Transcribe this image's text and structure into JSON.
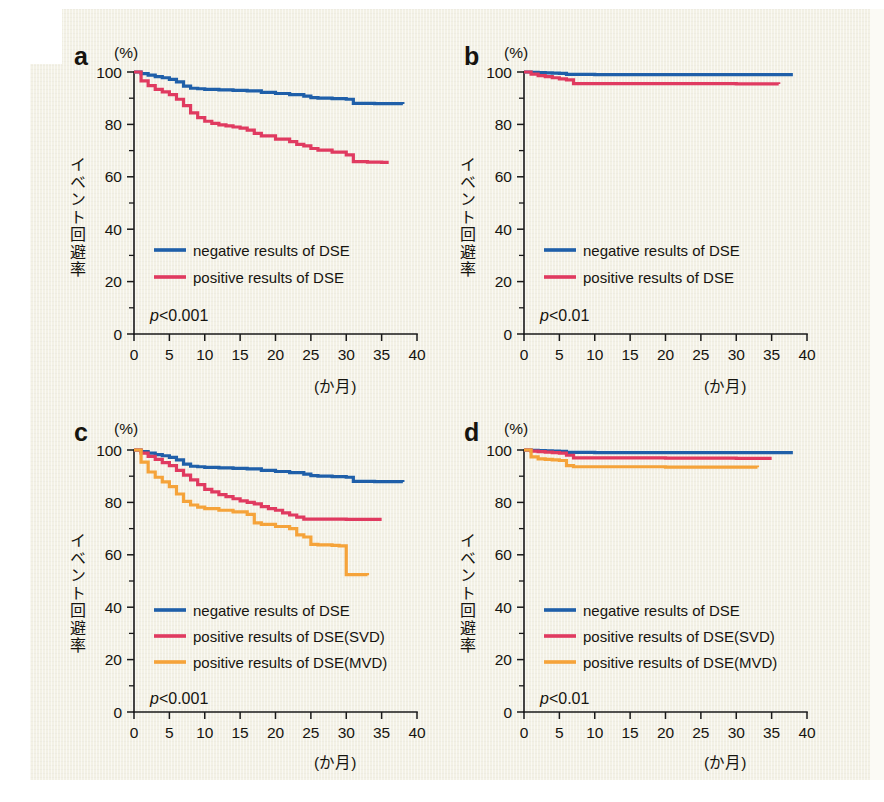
{
  "figure": {
    "background_color": "#f3f1e5",
    "panels": [
      "a",
      "b",
      "c",
      "d"
    ]
  },
  "colors": {
    "negative_dse": "#1f5fa9",
    "positive_dse": "#e03a60",
    "positive_dse_svd": "#e03a60",
    "positive_dse_mvd": "#f5a33a",
    "axis": "#1a1a1a",
    "text": "#16140f"
  },
  "axes": {
    "y_unit_label": "(%)",
    "y_axis_title": "イベント回避率",
    "x_unit_label": "(か月)",
    "y_ticks": [
      0,
      20,
      40,
      60,
      80,
      100
    ],
    "y_minor_ticks": [
      10,
      30,
      50,
      70,
      90
    ],
    "y_tick_labels": [
      "0",
      "20",
      "40",
      "60",
      "80",
      "100"
    ],
    "y_range": [
      0,
      100
    ],
    "x_ticks": [
      0,
      5,
      10,
      15,
      20,
      25,
      30,
      35,
      40
    ],
    "x_tick_labels": [
      "0",
      "5",
      "10",
      "15",
      "20",
      "25",
      "30",
      "35",
      "40"
    ],
    "x_range": [
      0,
      40
    ]
  },
  "chart_data": [
    {
      "id": "panel-a",
      "panel_letter": "a",
      "type": "line",
      "title": "",
      "xlabel": "(か月)",
      "ylabel": "イベント回避率",
      "y_unit": "(%)",
      "xlim": [
        0,
        40
      ],
      "ylim": [
        0,
        100
      ],
      "grid": false,
      "legend_position": "inside-lower-left",
      "annotation": "p<0.001",
      "annotation_prefix": "p",
      "annotation_suffix": "<0.001",
      "series": [
        {
          "name": "negative results of DSE",
          "color": "#1f5fa9",
          "x": [
            0,
            1,
            2,
            3,
            4,
            5,
            6,
            7,
            8,
            9,
            10,
            12,
            14,
            16,
            18,
            20,
            22,
            24,
            25,
            26,
            28,
            30,
            31,
            34,
            38
          ],
          "values": [
            100,
            99.4,
            98.8,
            98.2,
            97.8,
            97.2,
            96.2,
            94.6,
            93.8,
            93.6,
            93.4,
            93.2,
            93.0,
            92.8,
            92.2,
            91.8,
            91.4,
            90.8,
            90.2,
            90.0,
            89.8,
            89.6,
            88.0,
            87.9,
            87.8
          ]
        },
        {
          "name": "positive results of DSE",
          "color": "#e03a60",
          "x": [
            0,
            1,
            2,
            3,
            4,
            5,
            6,
            7,
            8,
            9,
            10,
            11,
            12,
            13,
            14,
            15,
            16,
            17,
            18,
            20,
            22,
            23,
            24,
            25,
            26,
            28,
            30,
            31,
            33,
            35,
            36
          ],
          "values": [
            100,
            96.6,
            94.8,
            93.4,
            92.4,
            91.4,
            89.6,
            87.2,
            84.4,
            82.6,
            81.2,
            80.4,
            79.8,
            79.4,
            79.0,
            78.6,
            77.8,
            76.6,
            75.6,
            74.4,
            73.4,
            72.4,
            71.8,
            70.8,
            70.2,
            69.4,
            68.4,
            65.8,
            65.6,
            65.5,
            65.5
          ]
        }
      ],
      "legend": [
        {
          "label": "negative results of DSE",
          "color": "#1f5fa9"
        },
        {
          "label": "positive results of DSE",
          "color": "#e03a60"
        }
      ]
    },
    {
      "id": "panel-b",
      "panel_letter": "b",
      "type": "line",
      "title": "",
      "xlabel": "(か月)",
      "ylabel": "イベント回避率",
      "y_unit": "(%)",
      "xlim": [
        0,
        40
      ],
      "ylim": [
        0,
        100
      ],
      "grid": false,
      "legend_position": "inside-lower-left",
      "annotation": "p<0.01",
      "annotation_prefix": "p",
      "annotation_suffix": "<0.01",
      "series": [
        {
          "name": "negative results of DSE",
          "color": "#1f5fa9",
          "x": [
            0,
            1,
            2,
            3,
            4,
            5,
            6,
            10,
            20,
            30,
            38
          ],
          "values": [
            100,
            99.9,
            99.8,
            99.7,
            99.6,
            99.5,
            99.1,
            99.0,
            99.0,
            99.0,
            99.0
          ]
        },
        {
          "name": "positive results of DSE",
          "color": "#e03a60",
          "x": [
            0,
            1,
            2,
            3,
            4,
            5,
            6,
            7,
            10,
            20,
            30,
            36
          ],
          "values": [
            100,
            99.2,
            98.6,
            98.2,
            97.8,
            97.4,
            97.0,
            95.6,
            95.6,
            95.6,
            95.5,
            95.4
          ]
        }
      ],
      "legend": [
        {
          "label": "negative results of DSE",
          "color": "#1f5fa9"
        },
        {
          "label": "positive results of DSE",
          "color": "#e03a60"
        }
      ]
    },
    {
      "id": "panel-c",
      "panel_letter": "c",
      "type": "line",
      "title": "",
      "xlabel": "(か月)",
      "ylabel": "イベント回避率",
      "y_unit": "(%)",
      "xlim": [
        0,
        40
      ],
      "ylim": [
        0,
        100
      ],
      "grid": false,
      "legend_position": "inside-lower-left",
      "annotation": "p<0.001",
      "annotation_prefix": "p",
      "annotation_suffix": "<0.001",
      "series": [
        {
          "name": "negative results of DSE",
          "color": "#1f5fa9",
          "x": [
            0,
            1,
            2,
            3,
            4,
            5,
            6,
            7,
            8,
            9,
            10,
            12,
            14,
            16,
            18,
            20,
            22,
            24,
            25,
            26,
            28,
            30,
            31,
            34,
            38
          ],
          "values": [
            100,
            99.4,
            98.8,
            98.2,
            97.8,
            97.2,
            96.2,
            94.6,
            93.8,
            93.6,
            93.4,
            93.2,
            93.0,
            92.8,
            92.2,
            91.8,
            91.4,
            90.8,
            90.2,
            90.0,
            89.8,
            89.6,
            88.0,
            87.9,
            87.8
          ]
        },
        {
          "name": "positive results of DSE(SVD)",
          "color": "#e03a60",
          "x": [
            0,
            1,
            2,
            3,
            4,
            5,
            6,
            7,
            8,
            9,
            10,
            11,
            12,
            13,
            14,
            15,
            16,
            17,
            18,
            19,
            20,
            21,
            22,
            23,
            24,
            30,
            35
          ],
          "values": [
            100,
            98.8,
            97.6,
            96.4,
            95.2,
            94.0,
            92.2,
            90.4,
            88.6,
            86.8,
            85.0,
            84.0,
            83.0,
            82.2,
            81.4,
            80.6,
            80.0,
            79.4,
            78.4,
            77.6,
            77.0,
            76.0,
            75.2,
            74.4,
            73.6,
            73.5,
            73.5
          ]
        },
        {
          "name": "positive results of DSE(MVD)",
          "color": "#f5a33a",
          "x": [
            0,
            1,
            2,
            3,
            4,
            5,
            6,
            7,
            8,
            9,
            10,
            12,
            14,
            16,
            17,
            18,
            20,
            22,
            23,
            24,
            25,
            26,
            28,
            29,
            30,
            33
          ],
          "values": [
            100,
            95.4,
            91.6,
            89.6,
            87.8,
            86.0,
            83.2,
            80.4,
            79.0,
            78.2,
            77.6,
            77.0,
            76.4,
            75.4,
            72.2,
            71.6,
            70.8,
            70.0,
            67.6,
            66.8,
            64.0,
            63.8,
            63.6,
            63.4,
            52.4,
            52.2
          ]
        }
      ],
      "legend": [
        {
          "label": "negative results of DSE",
          "color": "#1f5fa9"
        },
        {
          "label": "positive results of DSE(SVD)",
          "color": "#e03a60"
        },
        {
          "label": "positive results of DSE(MVD)",
          "color": "#f5a33a"
        }
      ]
    },
    {
      "id": "panel-d",
      "panel_letter": "d",
      "type": "line",
      "title": "",
      "xlabel": "(か月)",
      "ylabel": "イベント回避率",
      "y_unit": "(%)",
      "xlim": [
        0,
        40
      ],
      "ylim": [
        0,
        100
      ],
      "grid": false,
      "legend_position": "inside-lower-left",
      "annotation": "p<0.01",
      "annotation_prefix": "p",
      "annotation_suffix": "<0.01",
      "series": [
        {
          "name": "negative results of DSE",
          "color": "#1f5fa9",
          "x": [
            0,
            1,
            2,
            3,
            4,
            5,
            6,
            10,
            20,
            30,
            38
          ],
          "values": [
            100,
            99.9,
            99.8,
            99.7,
            99.6,
            99.5,
            99.1,
            99.0,
            99.0,
            99.0,
            99.0
          ]
        },
        {
          "name": "positive results of DSE(SVD)",
          "color": "#e03a60",
          "x": [
            0,
            1,
            2,
            3,
            4,
            5,
            6,
            7,
            10,
            20,
            30,
            35
          ],
          "values": [
            100,
            99.6,
            99.4,
            99.2,
            99.0,
            98.8,
            98.0,
            97.0,
            97.0,
            96.9,
            96.8,
            96.8
          ]
        },
        {
          "name": "positive results of DSE(MVD)",
          "color": "#f5a33a",
          "x": [
            0,
            1,
            2,
            3,
            4,
            5,
            6,
            7,
            10,
            20,
            30,
            33
          ],
          "values": [
            100,
            97.4,
            96.6,
            96.4,
            96.2,
            96.0,
            94.0,
            93.6,
            93.6,
            93.5,
            93.5,
            93.4
          ]
        }
      ],
      "legend": [
        {
          "label": "negative results of DSE",
          "color": "#1f5fa9"
        },
        {
          "label": "positive results of DSE(SVD)",
          "color": "#e03a60"
        },
        {
          "label": "positive results of DSE(MVD)",
          "color": "#f5a33a"
        }
      ]
    }
  ]
}
